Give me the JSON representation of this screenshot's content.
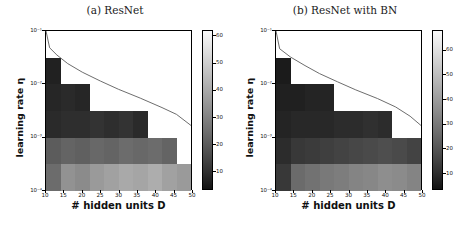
{
  "figure": {
    "panels": [
      {
        "tag": "a",
        "title": "(a) ResNet",
        "xlabel": "# hidden units D",
        "ylabel": "learning rate η",
        "xticks": [
          "10",
          "15",
          "20",
          "25",
          "30",
          "35",
          "40",
          "45",
          "50"
        ],
        "yticks": [
          "10⁻¹",
          "10⁻²",
          "10⁻³",
          "10⁻⁴"
        ],
        "colorbar_ticks": [
          "10",
          "20",
          "30",
          "40",
          "50",
          "60"
        ]
      },
      {
        "tag": "b",
        "title": "(b) ResNet with BN",
        "xlabel": "# hidden units D",
        "ylabel": "learning rate η",
        "xticks": [
          "10",
          "15",
          "20",
          "25",
          "30",
          "35",
          "40",
          "45",
          "50"
        ],
        "yticks": [
          "10⁻¹",
          "10⁻²",
          "10⁻³",
          "10⁻⁴"
        ],
        "colorbar_ticks": [
          "10",
          "20",
          "30",
          "40",
          "50",
          "60"
        ]
      }
    ]
  },
  "chart_data": [
    {
      "type": "heatmap",
      "panel": "a",
      "title": "(a) ResNet",
      "xlabel": "# hidden units D",
      "ylabel": "learning rate η",
      "xlim": [
        10,
        50
      ],
      "ylim": [
        0.0001,
        0.1
      ],
      "yscale": "log",
      "xscale": "linear",
      "grid": false,
      "colorbar": {
        "label": "",
        "vmin": 3,
        "vmax": 62,
        "ticks": [
          10,
          20,
          30,
          40,
          50,
          60
        ],
        "cmap": "grayscale-dark-low"
      },
      "x_edges": [
        10,
        14,
        18,
        22,
        26,
        30,
        34,
        38,
        42,
        46,
        50
      ],
      "x_centers": [
        12,
        16,
        20,
        24,
        28,
        32,
        36,
        40,
        44,
        48
      ],
      "y_edges": [
        0.1,
        0.0316,
        0.01,
        0.00316,
        0.001,
        0.000316,
        0.0001
      ],
      "y_centers": [
        0.0562,
        0.0178,
        0.00562,
        0.00178,
        0.000562,
        0.000178
      ],
      "null_color": "#ffffff",
      "note": "null = diverged / not trained (white staircase region upper-right)",
      "rows_top_to_bottom": [
        {
          "y_center": 0.0562,
          "values": [
            null,
            null,
            null,
            null,
            null,
            null,
            null,
            null,
            null,
            null
          ]
        },
        {
          "y_center": 0.0178,
          "values": [
            6,
            null,
            null,
            null,
            null,
            null,
            null,
            null,
            null,
            null
          ]
        },
        {
          "y_center": 0.00562,
          "values": [
            7,
            8,
            7,
            null,
            null,
            null,
            null,
            null,
            null,
            null
          ]
        },
        {
          "y_center": 0.00178,
          "values": [
            8,
            9,
            9,
            10,
            9,
            10,
            8,
            null,
            null,
            null
          ]
        },
        {
          "y_center": 0.000562,
          "values": [
            20,
            22,
            21,
            23,
            22,
            24,
            23,
            24,
            22,
            null
          ]
        },
        {
          "y_center": 0.000178,
          "values": [
            24,
            34,
            32,
            36,
            38,
            40,
            39,
            41,
            38,
            36
          ]
        },
        {
          "y_center": 0.0001,
          "values": [
            26,
            44,
            45,
            42,
            49,
            48,
            50,
            52,
            49,
            47
          ]
        }
      ],
      "theory_curve": {
        "label": "",
        "style": "solid-thin",
        "relation": "eta ~ c / D",
        "points": [
          [
            10,
            0.1
          ],
          [
            11,
            0.048
          ],
          [
            13,
            0.035
          ],
          [
            16,
            0.024
          ],
          [
            20,
            0.0165
          ],
          [
            25,
            0.0112
          ],
          [
            30,
            0.0078
          ],
          [
            36,
            0.0053
          ],
          [
            42,
            0.0035
          ],
          [
            46,
            0.0026
          ],
          [
            50,
            0.0016
          ]
        ]
      }
    },
    {
      "type": "heatmap",
      "panel": "b",
      "title": "(b) ResNet with BN",
      "xlabel": "# hidden units D",
      "ylabel": "learning rate η",
      "xlim": [
        10,
        50
      ],
      "ylim": [
        0.0001,
        0.1
      ],
      "yscale": "log",
      "xscale": "linear",
      "grid": false,
      "colorbar": {
        "label": "",
        "vmin": 3,
        "vmax": 68,
        "ticks": [
          10,
          20,
          30,
          40,
          50,
          60
        ],
        "cmap": "grayscale-dark-low"
      },
      "x_edges": [
        10,
        14,
        18,
        22,
        26,
        30,
        34,
        38,
        42,
        46,
        50
      ],
      "x_centers": [
        12,
        16,
        20,
        24,
        28,
        32,
        36,
        40,
        44,
        48
      ],
      "y_edges": [
        0.1,
        0.0316,
        0.01,
        0.00316,
        0.001,
        0.000316,
        0.0001
      ],
      "y_centers": [
        0.0562,
        0.0178,
        0.00562,
        0.00178,
        0.000562,
        0.000178
      ],
      "null_color": "#ffffff",
      "note": "null = diverged / not trained (white staircase region upper-right)",
      "rows_top_to_bottom": [
        {
          "y_center": 0.0562,
          "values": [
            null,
            null,
            null,
            null,
            null,
            null,
            null,
            null,
            null,
            null
          ]
        },
        {
          "y_center": 0.0178,
          "values": [
            5,
            null,
            null,
            null,
            null,
            null,
            null,
            null,
            null,
            null
          ]
        },
        {
          "y_center": 0.00562,
          "values": [
            6,
            6,
            7,
            7,
            null,
            null,
            null,
            null,
            null,
            null
          ]
        },
        {
          "y_center": 0.00178,
          "values": [
            7,
            8,
            8,
            8,
            9,
            9,
            10,
            9,
            null,
            null
          ]
        },
        {
          "y_center": 0.000562,
          "values": [
            9,
            12,
            13,
            14,
            15,
            16,
            17,
            18,
            17,
            15
          ]
        },
        {
          "y_center": 0.000178,
          "values": [
            12,
            26,
            28,
            30,
            31,
            33,
            34,
            36,
            35,
            33
          ]
        },
        {
          "y_center": 0.0001,
          "values": [
            14,
            32,
            34,
            36,
            38,
            40,
            42,
            44,
            43,
            41
          ]
        }
      ],
      "theory_curve": {
        "label": "",
        "style": "solid-thin",
        "relation": "eta ~ c / D",
        "points": [
          [
            10,
            0.1
          ],
          [
            11,
            0.046
          ],
          [
            14,
            0.032
          ],
          [
            18,
            0.022
          ],
          [
            22,
            0.0155
          ],
          [
            27,
            0.0108
          ],
          [
            32,
            0.0076
          ],
          [
            38,
            0.0052
          ],
          [
            43,
            0.0036
          ],
          [
            47,
            0.0024
          ],
          [
            50,
            0.0016
          ]
        ]
      }
    }
  ]
}
